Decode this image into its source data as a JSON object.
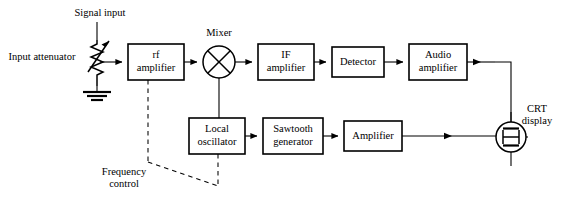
{
  "diagram": {
    "stroke_color": "#000000",
    "background_color": "#ffffff",
    "blocks": [
      {
        "id": "rf_amplifier",
        "lines": [
          "rf",
          "amplifier"
        ],
        "x": 128,
        "y": 44,
        "w": 56,
        "h": 36
      },
      {
        "id": "if_amplifier",
        "lines": [
          "IF",
          "amplifier"
        ],
        "x": 258,
        "y": 44,
        "w": 56,
        "h": 36
      },
      {
        "id": "detector",
        "lines": [
          "Detector"
        ],
        "x": 332,
        "y": 47,
        "w": 52,
        "h": 30
      },
      {
        "id": "audio_amplifier",
        "lines": [
          "Audio",
          "amplifier"
        ],
        "x": 409,
        "y": 44,
        "w": 58,
        "h": 36
      },
      {
        "id": "local_oscillator",
        "lines": [
          "Local",
          "oscillator"
        ],
        "x": 189,
        "y": 118,
        "w": 56,
        "h": 36
      },
      {
        "id": "sawtooth_generator",
        "lines": [
          "Sawtooth",
          "generator"
        ],
        "x": 263,
        "y": 118,
        "w": 60,
        "h": 36
      },
      {
        "id": "amplifier",
        "lines": [
          "Amplifier"
        ],
        "x": 344,
        "y": 121,
        "w": 58,
        "h": 30
      }
    ],
    "labels": [
      {
        "id": "signal_input",
        "text": "Signal input",
        "x": 100,
        "y": 14,
        "anchor": "middle"
      },
      {
        "id": "input_attenuator",
        "text": "Input attenuator",
        "x": 42,
        "y": 58,
        "anchor": "middle"
      },
      {
        "id": "mixer",
        "text": "Mixer",
        "x": 219,
        "y": 34,
        "anchor": "middle"
      },
      {
        "id": "crt_display_l1",
        "text": "CRT",
        "x": 537,
        "y": 110,
        "anchor": "middle"
      },
      {
        "id": "crt_display_l2",
        "text": "display",
        "x": 537,
        "y": 122,
        "anchor": "middle"
      },
      {
        "id": "frequency_l1",
        "text": "Frequency",
        "x": 124,
        "y": 173,
        "anchor": "middle"
      },
      {
        "id": "frequency_l2",
        "text": "control",
        "x": 124,
        "y": 185,
        "anchor": "middle"
      }
    ],
    "symbols": {
      "mixer": {
        "id": "mixer-symbol",
        "cx": 219,
        "cy": 62,
        "r": 16
      },
      "crt": {
        "id": "crt-symbol",
        "cx": 511,
        "cy": 137,
        "r": 15
      },
      "attenuator": {
        "id": "variable-resistor-symbol",
        "x": 97,
        "y_top": 40,
        "y_bottom": 86
      },
      "ground": {
        "id": "ground-symbol",
        "x": 97,
        "y": 92
      }
    },
    "connections": [
      {
        "id": "signal-input-to-attenuator",
        "type": "solid"
      },
      {
        "id": "attenuator-to-rf-amplifier",
        "type": "solid"
      },
      {
        "id": "attenuator-to-ground",
        "type": "solid"
      },
      {
        "id": "rf-amplifier-to-mixer",
        "type": "solid"
      },
      {
        "id": "mixer-to-if-amplifier",
        "type": "solid"
      },
      {
        "id": "if-amplifier-to-detector",
        "type": "solid"
      },
      {
        "id": "detector-to-audio-amplifier",
        "type": "solid"
      },
      {
        "id": "audio-amplifier-to-crt",
        "type": "solid"
      },
      {
        "id": "mixer-to-local-oscillator",
        "type": "solid"
      },
      {
        "id": "local-oscillator-to-sawtooth-generator",
        "type": "solid"
      },
      {
        "id": "sawtooth-generator-to-amplifier",
        "type": "solid"
      },
      {
        "id": "amplifier-to-crt",
        "type": "solid"
      },
      {
        "id": "frequency-control-to-rf-amplifier",
        "type": "dashed"
      },
      {
        "id": "frequency-control-to-local-oscillator",
        "type": "dashed"
      }
    ]
  }
}
